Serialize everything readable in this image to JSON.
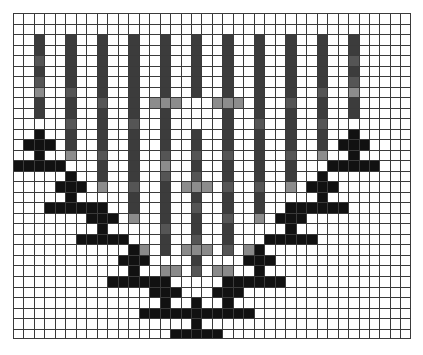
{
  "figure": {
    "title": "",
    "background_color": "#ffffff",
    "grid": {
      "columns": 38,
      "rows": 31,
      "cell_width": 10.47,
      "cell_height": 10.52,
      "line_color": "#3a3a3a",
      "origin_x": 13,
      "origin_y": 13,
      "width": 398,
      "height": 326,
      "visible": true
    },
    "palette": {
      "marker_black": "#111111",
      "bar_dark": "#3c3c3c",
      "bar_mid": "#555555",
      "bar_light": "#8c8c8c",
      "errorbar_gray": "#8a8a8a",
      "white": "#ffffff"
    }
  },
  "chart_data": {
    "type": "scatter",
    "title": "",
    "subtitle": "",
    "xlabel": "",
    "ylabel": "",
    "xlim": [
      0,
      38
    ],
    "ylim": [
      0,
      31
    ],
    "grid": true,
    "legend_position": "none",
    "annotations": [],
    "x": [
      2,
      5,
      8,
      11,
      14,
      17,
      20,
      23,
      26,
      29,
      32
    ],
    "y": [
      12,
      16,
      19,
      23,
      26,
      28,
      26,
      23,
      19,
      16,
      12
    ],
    "xtick_labels": [],
    "ytick_labels": [],
    "series": [
      {
        "name": "markers-with-error-bars",
        "marker": "plus",
        "marker_color": "#111111",
        "errorbar_color": "#3c3c3c",
        "values": [
          12,
          16,
          19,
          23,
          26,
          28,
          26,
          23,
          19,
          16,
          12
        ]
      }
    ],
    "points": [
      {
        "index": 0,
        "col": 2,
        "marker_row": 12,
        "bar_top": 2,
        "bar_bottom": 13,
        "h_error": false
      },
      {
        "index": 1,
        "col": 5,
        "marker_row": 16,
        "bar_top": 2,
        "bar_bottom": 17,
        "h_error": false
      },
      {
        "index": 2,
        "col": 8,
        "marker_row": 19,
        "bar_top": 2,
        "bar_bottom": 20,
        "h_error": false
      },
      {
        "index": 3,
        "col": 11,
        "marker_row": 23,
        "bar_top": 2,
        "bar_bottom": 24,
        "h_error": false
      },
      {
        "index": 4,
        "col": 14,
        "marker_row": 26,
        "bar_top": 2,
        "bar_bottom": 27,
        "h_error": true
      },
      {
        "index": 5,
        "col": 17,
        "marker_row": 28,
        "bar_top": 2,
        "bar_bottom": 29,
        "h_error": true
      },
      {
        "index": 6,
        "col": 20,
        "marker_row": 26,
        "bar_top": 2,
        "bar_bottom": 27,
        "h_error": true
      },
      {
        "index": 7,
        "col": 23,
        "marker_row": 23,
        "bar_top": 2,
        "bar_bottom": 24,
        "h_error": false
      },
      {
        "index": 8,
        "col": 26,
        "marker_row": 19,
        "bar_top": 2,
        "bar_bottom": 20,
        "h_error": false
      },
      {
        "index": 9,
        "col": 29,
        "marker_row": 16,
        "bar_top": 2,
        "bar_bottom": 17,
        "h_error": false
      },
      {
        "index": 10,
        "col": 32,
        "marker_row": 12,
        "bar_top": 2,
        "bar_bottom": 13,
        "h_error": false
      }
    ],
    "rendered_cells": [
      {
        "c": 2,
        "r": 2,
        "color": "#3c3c3c"
      },
      {
        "c": 2,
        "r": 3,
        "color": "#3c3c3c"
      },
      {
        "c": 2,
        "r": 4,
        "color": "#555555"
      },
      {
        "c": 2,
        "r": 5,
        "color": "#3c3c3c"
      },
      {
        "c": 2,
        "r": 6,
        "color": "#555555"
      },
      {
        "c": 2,
        "r": 7,
        "color": "#8c8c8c"
      },
      {
        "c": 2,
        "r": 8,
        "color": "#3c3c3c"
      },
      {
        "c": 2,
        "r": 9,
        "color": "#3c3c3c"
      },
      {
        "c": 5,
        "r": 2,
        "color": "#3c3c3c"
      },
      {
        "c": 5,
        "r": 3,
        "color": "#3c3c3c"
      },
      {
        "c": 5,
        "r": 4,
        "color": "#3c3c3c"
      },
      {
        "c": 5,
        "r": 5,
        "color": "#3c3c3c"
      },
      {
        "c": 5,
        "r": 6,
        "color": "#3c3c3c"
      },
      {
        "c": 5,
        "r": 7,
        "color": "#555555"
      },
      {
        "c": 5,
        "r": 8,
        "color": "#3c3c3c"
      },
      {
        "c": 5,
        "r": 9,
        "color": "#3c3c3c"
      },
      {
        "c": 5,
        "r": 10,
        "color": "#555555"
      },
      {
        "c": 5,
        "r": 11,
        "color": "#3c3c3c"
      },
      {
        "c": 5,
        "r": 12,
        "color": "#3c3c3c"
      },
      {
        "c": 5,
        "r": 13,
        "color": "#8c8c8c"
      },
      {
        "c": 8,
        "r": 2,
        "color": "#3c3c3c"
      },
      {
        "c": 8,
        "r": 3,
        "color": "#3c3c3c"
      },
      {
        "c": 8,
        "r": 4,
        "color": "#3c3c3c"
      },
      {
        "c": 8,
        "r": 5,
        "color": "#3c3c3c"
      },
      {
        "c": 8,
        "r": 6,
        "color": "#3c3c3c"
      },
      {
        "c": 8,
        "r": 7,
        "color": "#3c3c3c"
      },
      {
        "c": 8,
        "r": 8,
        "color": "#555555"
      },
      {
        "c": 8,
        "r": 9,
        "color": "#3c3c3c"
      },
      {
        "c": 8,
        "r": 10,
        "color": "#3c3c3c"
      },
      {
        "c": 8,
        "r": 11,
        "color": "#3c3c3c"
      },
      {
        "c": 8,
        "r": 12,
        "color": "#3c3c3c"
      },
      {
        "c": 8,
        "r": 13,
        "color": "#555555"
      },
      {
        "c": 8,
        "r": 14,
        "color": "#3c3c3c"
      },
      {
        "c": 8,
        "r": 15,
        "color": "#3c3c3c"
      },
      {
        "c": 8,
        "r": 16,
        "color": "#8c8c8c"
      },
      {
        "c": 11,
        "r": 2,
        "color": "#3c3c3c"
      },
      {
        "c": 11,
        "r": 3,
        "color": "#3c3c3c"
      },
      {
        "c": 11,
        "r": 4,
        "color": "#3c3c3c"
      },
      {
        "c": 11,
        "r": 5,
        "color": "#3c3c3c"
      },
      {
        "c": 11,
        "r": 6,
        "color": "#3c3c3c"
      },
      {
        "c": 11,
        "r": 7,
        "color": "#3c3c3c"
      },
      {
        "c": 11,
        "r": 8,
        "color": "#3c3c3c"
      },
      {
        "c": 11,
        "r": 9,
        "color": "#3c3c3c"
      },
      {
        "c": 11,
        "r": 10,
        "color": "#555555"
      },
      {
        "c": 11,
        "r": 11,
        "color": "#3c3c3c"
      },
      {
        "c": 11,
        "r": 12,
        "color": "#3c3c3c"
      },
      {
        "c": 11,
        "r": 13,
        "color": "#3c3c3c"
      },
      {
        "c": 11,
        "r": 14,
        "color": "#3c3c3c"
      },
      {
        "c": 11,
        "r": 15,
        "color": "#3c3c3c"
      },
      {
        "c": 11,
        "r": 16,
        "color": "#555555"
      },
      {
        "c": 11,
        "r": 17,
        "color": "#3c3c3c"
      },
      {
        "c": 11,
        "r": 18,
        "color": "#3c3c3c"
      },
      {
        "c": 11,
        "r": 19,
        "color": "#8c8c8c"
      },
      {
        "c": 14,
        "r": 2,
        "color": "#3c3c3c"
      },
      {
        "c": 14,
        "r": 3,
        "color": "#3c3c3c"
      },
      {
        "c": 14,
        "r": 4,
        "color": "#3c3c3c"
      },
      {
        "c": 14,
        "r": 5,
        "color": "#3c3c3c"
      },
      {
        "c": 14,
        "r": 6,
        "color": "#3c3c3c"
      },
      {
        "c": 14,
        "r": 7,
        "color": "#3c3c3c"
      },
      {
        "c": 14,
        "r": 9,
        "color": "#3c3c3c"
      },
      {
        "c": 14,
        "r": 10,
        "color": "#3c3c3c"
      },
      {
        "c": 14,
        "r": 11,
        "color": "#3c3c3c"
      },
      {
        "c": 14,
        "r": 12,
        "color": "#3c3c3c"
      },
      {
        "c": 14,
        "r": 13,
        "color": "#555555"
      },
      {
        "c": 14,
        "r": 14,
        "color": "#8c8c8c"
      },
      {
        "c": 14,
        "r": 15,
        "color": "#555555"
      },
      {
        "c": 14,
        "r": 16,
        "color": "#3c3c3c"
      },
      {
        "c": 14,
        "r": 17,
        "color": "#3c3c3c"
      },
      {
        "c": 14,
        "r": 18,
        "color": "#3c3c3c"
      },
      {
        "c": 14,
        "r": 19,
        "color": "#3c3c3c"
      },
      {
        "c": 14,
        "r": 20,
        "color": "#555555"
      },
      {
        "c": 14,
        "r": 21,
        "color": "#3c3c3c"
      },
      {
        "c": 14,
        "r": 22,
        "color": "#3c3c3c"
      },
      {
        "c": 13,
        "r": 8,
        "color": "#8c8c8c"
      },
      {
        "c": 14,
        "r": 8,
        "color": "#8c8c8c"
      },
      {
        "c": 15,
        "r": 8,
        "color": "#8c8c8c"
      },
      {
        "c": 17,
        "r": 2,
        "color": "#3c3c3c"
      },
      {
        "c": 17,
        "r": 3,
        "color": "#3c3c3c"
      },
      {
        "c": 17,
        "r": 4,
        "color": "#3c3c3c"
      },
      {
        "c": 17,
        "r": 5,
        "color": "#3c3c3c"
      },
      {
        "c": 17,
        "r": 6,
        "color": "#3c3c3c"
      },
      {
        "c": 17,
        "r": 7,
        "color": "#3c3c3c"
      },
      {
        "c": 17,
        "r": 11,
        "color": "#3c3c3c"
      },
      {
        "c": 17,
        "r": 12,
        "color": "#3c3c3c"
      },
      {
        "c": 17,
        "r": 13,
        "color": "#555555"
      },
      {
        "c": 17,
        "r": 14,
        "color": "#3c3c3c"
      },
      {
        "c": 17,
        "r": 15,
        "color": "#555555"
      },
      {
        "c": 17,
        "r": 17,
        "color": "#3c3c3c"
      },
      {
        "c": 17,
        "r": 18,
        "color": "#555555"
      },
      {
        "c": 17,
        "r": 19,
        "color": "#3c3c3c"
      },
      {
        "c": 17,
        "r": 20,
        "color": "#3c3c3c"
      },
      {
        "c": 17,
        "r": 21,
        "color": "#555555"
      },
      {
        "c": 17,
        "r": 22,
        "color": "#3c3c3c"
      },
      {
        "c": 17,
        "r": 23,
        "color": "#3c3c3c"
      },
      {
        "c": 17,
        "r": 24,
        "color": "#555555"
      },
      {
        "c": 16,
        "r": 16,
        "color": "#8c8c8c"
      },
      {
        "c": 17,
        "r": 16,
        "color": "#8c8c8c"
      },
      {
        "c": 18,
        "r": 16,
        "color": "#8c8c8c"
      },
      {
        "c": 20,
        "r": 2,
        "color": "#3c3c3c"
      },
      {
        "c": 20,
        "r": 3,
        "color": "#3c3c3c"
      },
      {
        "c": 20,
        "r": 4,
        "color": "#3c3c3c"
      },
      {
        "c": 20,
        "r": 5,
        "color": "#3c3c3c"
      },
      {
        "c": 20,
        "r": 6,
        "color": "#3c3c3c"
      },
      {
        "c": 20,
        "r": 7,
        "color": "#3c3c3c"
      },
      {
        "c": 20,
        "r": 9,
        "color": "#3c3c3c"
      },
      {
        "c": 20,
        "r": 10,
        "color": "#3c3c3c"
      },
      {
        "c": 20,
        "r": 11,
        "color": "#3c3c3c"
      },
      {
        "c": 20,
        "r": 12,
        "color": "#3c3c3c"
      },
      {
        "c": 20,
        "r": 13,
        "color": "#555555"
      },
      {
        "c": 20,
        "r": 14,
        "color": "#3c3c3c"
      },
      {
        "c": 20,
        "r": 15,
        "color": "#3c3c3c"
      },
      {
        "c": 20,
        "r": 16,
        "color": "#555555"
      },
      {
        "c": 20,
        "r": 17,
        "color": "#3c3c3c"
      },
      {
        "c": 20,
        "r": 18,
        "color": "#3c3c3c"
      },
      {
        "c": 20,
        "r": 19,
        "color": "#555555"
      },
      {
        "c": 20,
        "r": 20,
        "color": "#3c3c3c"
      },
      {
        "c": 20,
        "r": 21,
        "color": "#3c3c3c"
      },
      {
        "c": 20,
        "r": 22,
        "color": "#555555"
      },
      {
        "c": 19,
        "r": 8,
        "color": "#8c8c8c"
      },
      {
        "c": 20,
        "r": 8,
        "color": "#8c8c8c"
      },
      {
        "c": 21,
        "r": 8,
        "color": "#8c8c8c"
      },
      {
        "c": 23,
        "r": 2,
        "color": "#3c3c3c"
      },
      {
        "c": 23,
        "r": 3,
        "color": "#3c3c3c"
      },
      {
        "c": 23,
        "r": 4,
        "color": "#3c3c3c"
      },
      {
        "c": 23,
        "r": 5,
        "color": "#3c3c3c"
      },
      {
        "c": 23,
        "r": 6,
        "color": "#3c3c3c"
      },
      {
        "c": 23,
        "r": 7,
        "color": "#3c3c3c"
      },
      {
        "c": 23,
        "r": 8,
        "color": "#3c3c3c"
      },
      {
        "c": 23,
        "r": 9,
        "color": "#3c3c3c"
      },
      {
        "c": 23,
        "r": 10,
        "color": "#555555"
      },
      {
        "c": 23,
        "r": 11,
        "color": "#3c3c3c"
      },
      {
        "c": 23,
        "r": 12,
        "color": "#3c3c3c"
      },
      {
        "c": 23,
        "r": 13,
        "color": "#3c3c3c"
      },
      {
        "c": 23,
        "r": 14,
        "color": "#3c3c3c"
      },
      {
        "c": 23,
        "r": 15,
        "color": "#3c3c3c"
      },
      {
        "c": 23,
        "r": 16,
        "color": "#555555"
      },
      {
        "c": 23,
        "r": 17,
        "color": "#3c3c3c"
      },
      {
        "c": 23,
        "r": 18,
        "color": "#3c3c3c"
      },
      {
        "c": 23,
        "r": 19,
        "color": "#8c8c8c"
      },
      {
        "c": 26,
        "r": 2,
        "color": "#3c3c3c"
      },
      {
        "c": 26,
        "r": 3,
        "color": "#3c3c3c"
      },
      {
        "c": 26,
        "r": 4,
        "color": "#3c3c3c"
      },
      {
        "c": 26,
        "r": 5,
        "color": "#3c3c3c"
      },
      {
        "c": 26,
        "r": 6,
        "color": "#3c3c3c"
      },
      {
        "c": 26,
        "r": 7,
        "color": "#3c3c3c"
      },
      {
        "c": 26,
        "r": 8,
        "color": "#555555"
      },
      {
        "c": 26,
        "r": 9,
        "color": "#3c3c3c"
      },
      {
        "c": 26,
        "r": 10,
        "color": "#3c3c3c"
      },
      {
        "c": 26,
        "r": 11,
        "color": "#3c3c3c"
      },
      {
        "c": 26,
        "r": 12,
        "color": "#3c3c3c"
      },
      {
        "c": 26,
        "r": 13,
        "color": "#555555"
      },
      {
        "c": 26,
        "r": 14,
        "color": "#3c3c3c"
      },
      {
        "c": 26,
        "r": 15,
        "color": "#3c3c3c"
      },
      {
        "c": 26,
        "r": 16,
        "color": "#8c8c8c"
      },
      {
        "c": 29,
        "r": 2,
        "color": "#3c3c3c"
      },
      {
        "c": 29,
        "r": 3,
        "color": "#3c3c3c"
      },
      {
        "c": 29,
        "r": 4,
        "color": "#3c3c3c"
      },
      {
        "c": 29,
        "r": 5,
        "color": "#3c3c3c"
      },
      {
        "c": 29,
        "r": 6,
        "color": "#3c3c3c"
      },
      {
        "c": 29,
        "r": 7,
        "color": "#555555"
      },
      {
        "c": 29,
        "r": 8,
        "color": "#3c3c3c"
      },
      {
        "c": 29,
        "r": 9,
        "color": "#3c3c3c"
      },
      {
        "c": 29,
        "r": 10,
        "color": "#555555"
      },
      {
        "c": 29,
        "r": 11,
        "color": "#3c3c3c"
      },
      {
        "c": 29,
        "r": 12,
        "color": "#3c3c3c"
      },
      {
        "c": 29,
        "r": 13,
        "color": "#8c8c8c"
      },
      {
        "c": 32,
        "r": 2,
        "color": "#3c3c3c"
      },
      {
        "c": 32,
        "r": 3,
        "color": "#3c3c3c"
      },
      {
        "c": 32,
        "r": 4,
        "color": "#555555"
      },
      {
        "c": 32,
        "r": 5,
        "color": "#3c3c3c"
      },
      {
        "c": 32,
        "r": 6,
        "color": "#555555"
      },
      {
        "c": 32,
        "r": 7,
        "color": "#8c8c8c"
      },
      {
        "c": 32,
        "r": 8,
        "color": "#3c3c3c"
      },
      {
        "c": 32,
        "r": 9,
        "color": "#3c3c3c"
      }
    ]
  }
}
